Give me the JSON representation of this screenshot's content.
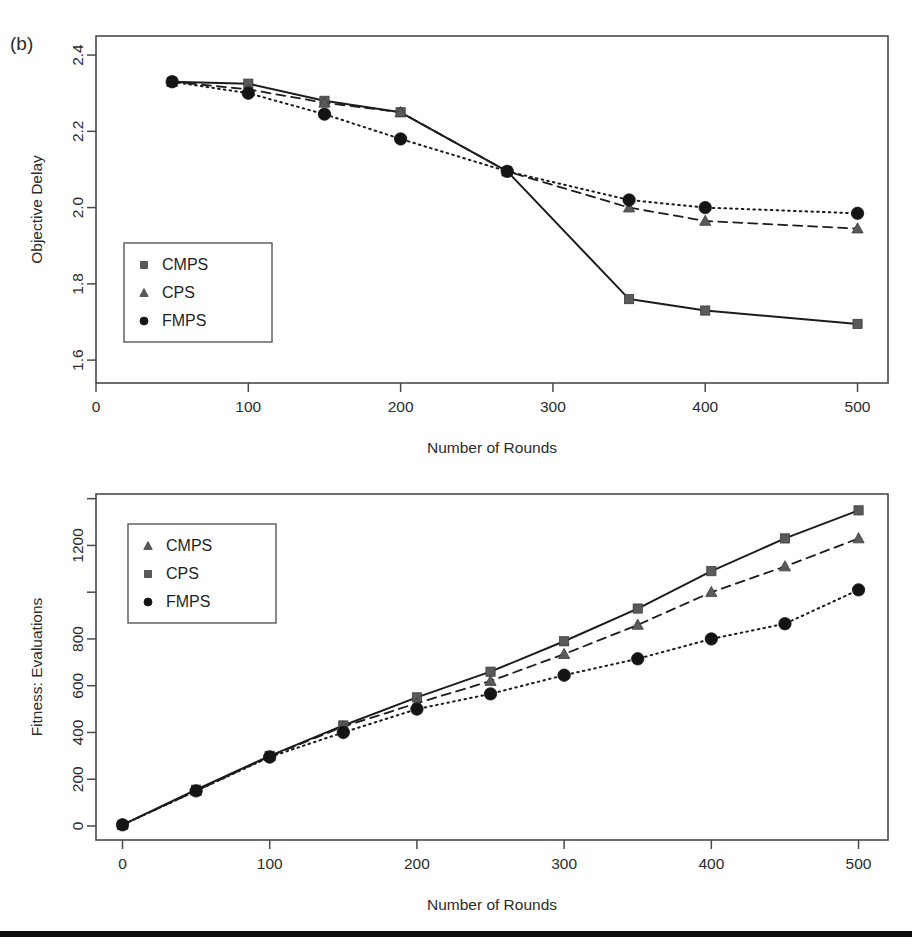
{
  "figure": {
    "panel_tag": "(b)",
    "footer_rule_color": "#0d0d0d"
  },
  "chart_data": [
    {
      "id": "objective-delay",
      "type": "line",
      "title": "",
      "panel_label": "(b)",
      "xlabel": "Number of Rounds",
      "ylabel": "Objective Delay",
      "xlim": [
        0,
        520
      ],
      "ylim": [
        1.54,
        2.45
      ],
      "xticks": [
        0,
        100,
        200,
        300,
        400,
        500
      ],
      "xticklabels": [
        "0",
        "100",
        "200",
        "300",
        "400",
        "500"
      ],
      "yticks": [
        1.6,
        1.8,
        2.0,
        2.2,
        2.4
      ],
      "yticklabels": [
        "1.6",
        "1.8",
        "2.0",
        "2.2",
        "2.4"
      ],
      "grid": false,
      "legend_position": "left-middle",
      "legend_entries": [
        "CMPS",
        "CPS",
        "FMPS"
      ],
      "series": [
        {
          "name": "CMPS",
          "marker": "square",
          "dash": "solid",
          "x": [
            50,
            100,
            150,
            200,
            270,
            350,
            400,
            500
          ],
          "values": [
            2.33,
            2.325,
            2.28,
            2.25,
            2.095,
            1.76,
            1.73,
            1.695
          ]
        },
        {
          "name": "CPS",
          "marker": "triangle",
          "dash": "dashed",
          "x": [
            50,
            100,
            150,
            200,
            270,
            350,
            400,
            500
          ],
          "values": [
            2.33,
            2.31,
            2.275,
            2.25,
            2.095,
            2.0,
            1.965,
            1.945
          ]
        },
        {
          "name": "FMPS",
          "marker": "circle",
          "dash": "dotted",
          "x": [
            50,
            100,
            150,
            200,
            270,
            350,
            400,
            500
          ],
          "values": [
            2.33,
            2.3,
            2.245,
            2.18,
            2.095,
            2.02,
            2.0,
            1.985
          ]
        }
      ]
    },
    {
      "id": "fitness-evaluations",
      "type": "line",
      "title": "",
      "xlabel": "Number of Rounds",
      "ylabel": "Fitness: Evaluations",
      "xlim": [
        -18,
        520
      ],
      "ylim": [
        -60,
        1420
      ],
      "xticks": [
        0,
        100,
        200,
        300,
        400,
        500
      ],
      "xticklabels": [
        "0",
        "100",
        "200",
        "300",
        "400",
        "500"
      ],
      "yticks": [
        0,
        200,
        400,
        600,
        800,
        1000,
        1200,
        1400
      ],
      "yticklabels": [
        "0",
        "200",
        "400",
        "600",
        "800",
        "",
        "1200",
        ""
      ],
      "grid": false,
      "legend_position": "left-top",
      "legend_entries": [
        "CMPS",
        "CPS",
        "FMPS"
      ],
      "series": [
        {
          "name": "CPS",
          "marker": "square",
          "dash": "solid",
          "x": [
            0,
            50,
            100,
            150,
            200,
            250,
            300,
            350,
            400,
            450,
            500
          ],
          "values": [
            5,
            155,
            300,
            430,
            550,
            660,
            790,
            930,
            1090,
            1230,
            1350
          ]
        },
        {
          "name": "CMPS",
          "marker": "triangle",
          "dash": "dashed",
          "x": [
            0,
            50,
            100,
            150,
            200,
            250,
            300,
            350,
            400,
            450,
            500
          ],
          "values": [
            5,
            150,
            298,
            425,
            525,
            620,
            735,
            860,
            1000,
            1110,
            1230
          ]
        },
        {
          "name": "FMPS",
          "marker": "circle",
          "dash": "dotted",
          "x": [
            0,
            50,
            100,
            150,
            200,
            250,
            300,
            350,
            400,
            450,
            500
          ],
          "values": [
            5,
            150,
            295,
            400,
            500,
            565,
            645,
            715,
            800,
            865,
            1010
          ]
        }
      ]
    }
  ]
}
